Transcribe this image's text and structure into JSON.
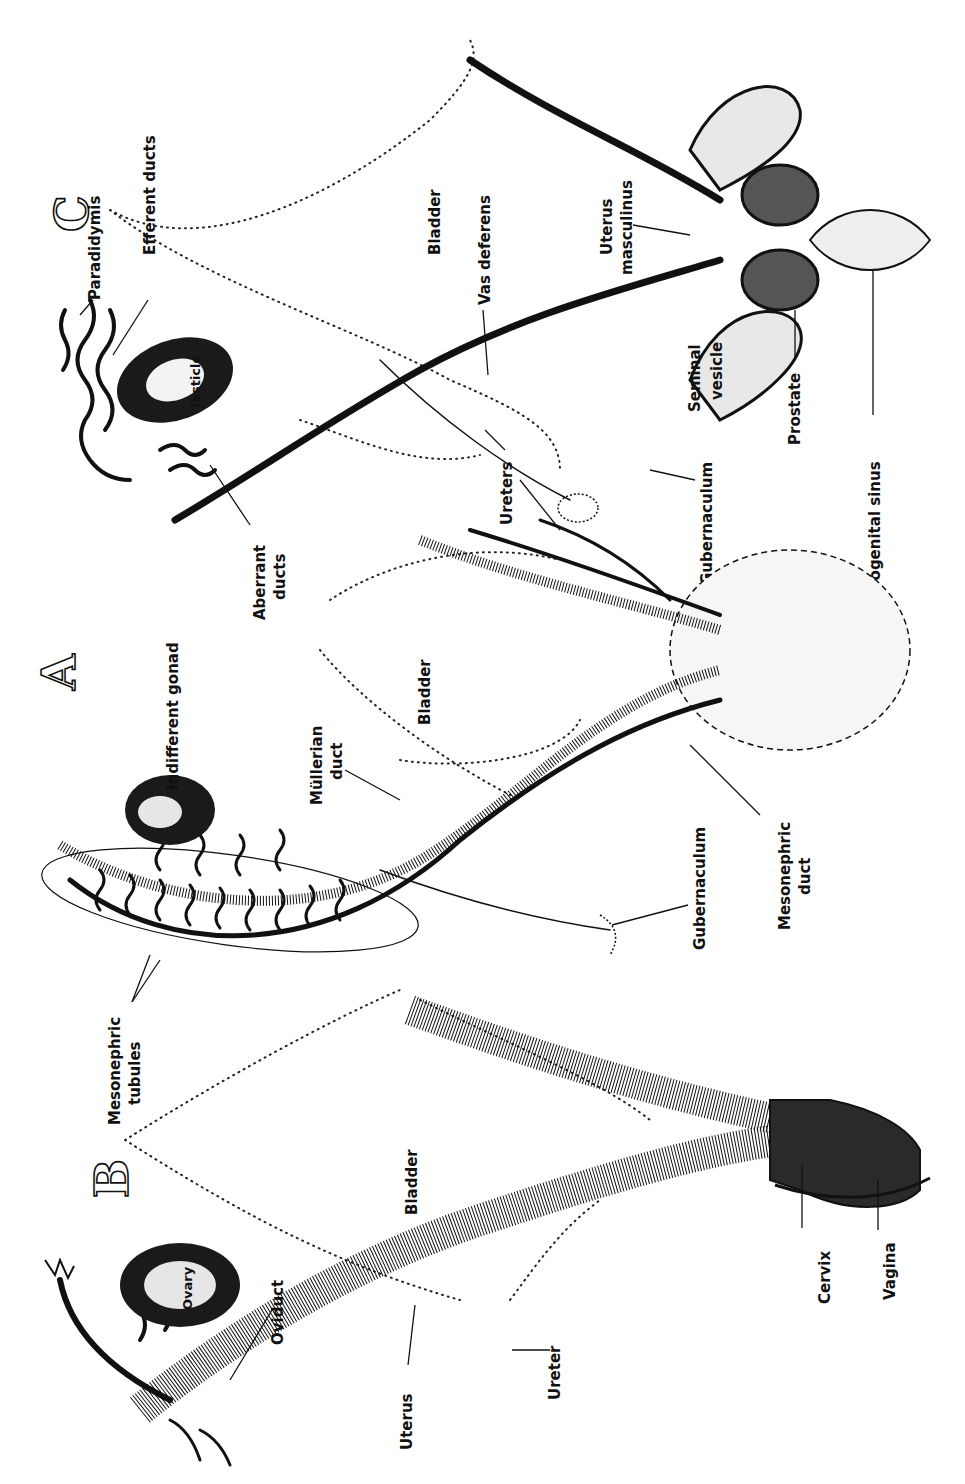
{
  "figure": {
    "orientation": "rotated 90 degrees counter-clockwise (text reads bottom-to-top)",
    "panels": [
      {
        "id": "A",
        "letter": "A",
        "subject": "indifferent stage",
        "labels": {
          "indifferent_gonad": "Indifferent gonad",
          "mullerian_duct": "Müllerian duct",
          "bladder": "Bladder",
          "gubernaculum": "Gubernaculum",
          "mesonephric_duct": "Mesonephric duct",
          "mesonephric_tubules": "Mesonephric tubules",
          "urogenital_sinus": "Urogenital sinus"
        }
      },
      {
        "id": "B",
        "letter": "B",
        "subject": "female",
        "labels": {
          "bladder": "Bladder",
          "ovary": "Ovary",
          "oviduct": "Oviduct",
          "uterus": "Uterus",
          "ureter": "Ureter",
          "cervix": "Cervix",
          "vagina": "Vagina"
        }
      },
      {
        "id": "C",
        "letter": "C",
        "subject": "male",
        "labels": {
          "paradidymis": "Paradidymis",
          "efferent_ducts": "Efferent ducts",
          "bladder": "Bladder",
          "vas_deferens": "Vas deferens",
          "uterus_masculinus": "Uterus masculinus",
          "testicle": "Testicle",
          "seminal_vesicle": "Seminal vesicle",
          "prostate": "Prostate",
          "aberrant_ducts": "Aberrant ducts",
          "ureters": "Ureters",
          "gubernaculum": "Gubernaculum",
          "urogenital_sinus": "Urogenital sinus"
        }
      }
    ]
  },
  "labels": {
    "A": "A",
    "B": "B",
    "C": "C",
    "paradidymis": "Paradidymis",
    "efferent": "Efferent ducts",
    "bladder_c": "Bladder",
    "vas_deferens": "Vas deferens",
    "uterus_masc_1": "Uterus",
    "uterus_masc_2": "masculinus",
    "testicle": "Testicle",
    "seminal_1": "Seminal",
    "seminal_2": "vesicle",
    "prostate": "Prostate",
    "aberrant_1": "Aberrant",
    "aberrant_2": "ducts",
    "ureters": "Ureters",
    "gubernaculum_c": "Gubernaculum",
    "urogenital_sinus": "Urogenital sinus",
    "indifferent_gonad": "Indifferent gonad",
    "mullerian_1": "Müllerian",
    "mullerian_2": "duct",
    "bladder_a": "Bladder",
    "gubernaculum_a": "Gubernaculum",
    "mesonephric_duct_1": "Mesonephric",
    "mesonephric_duct_2": "duct",
    "mesonephric_tub_1": "Mesonephric",
    "mesonephric_tub_2": "tubules",
    "bladder_b": "Bladder",
    "ovary": "Ovary",
    "oviduct": "Oviduct",
    "uterus": "Uterus",
    "ureter": "Ureter",
    "cervix": "Cervix",
    "vagina": "Vagina"
  },
  "colors": {
    "ink": "#111111",
    "paper": "#ffffff"
  }
}
